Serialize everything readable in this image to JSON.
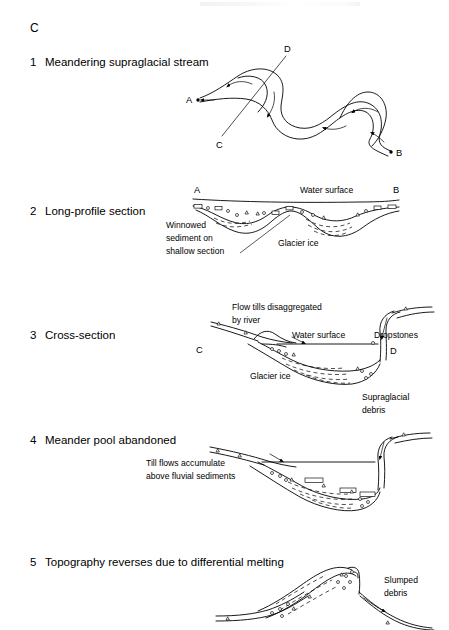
{
  "figure": {
    "group_letter": "C",
    "domain": "glacial geomorphology schematic",
    "panels": [
      {
        "number": "1",
        "title": "Meandering supraglacial stream",
        "point_labels": [
          "A",
          "B",
          "C",
          "D"
        ],
        "annotations": []
      },
      {
        "number": "2",
        "title": "Long-profile section",
        "point_labels": [
          "A",
          "B"
        ],
        "annotations": [
          "Water surface",
          "Winnowed",
          "sediment on",
          "shallow section",
          "Glacier ice"
        ]
      },
      {
        "number": "3",
        "title": "Cross-section",
        "point_labels": [
          "C",
          "D"
        ],
        "annotations": [
          "Flow tills disaggregated",
          "by river",
          "Water surface",
          "Dropstones",
          "Glacier ice"
        ]
      },
      {
        "number": "4",
        "title": "Meander pool abandoned",
        "point_labels": [],
        "annotations": [
          "Supraglacial",
          "debris",
          "Till flows accumulate",
          "above fluvial sediments"
        ]
      },
      {
        "number": "5",
        "title": "Topography reverses due to differential melting",
        "point_labels": [],
        "annotations": [
          "Slumped",
          "debris"
        ]
      }
    ]
  },
  "colors": {
    "ink": "#000000",
    "background": "#ffffff"
  }
}
